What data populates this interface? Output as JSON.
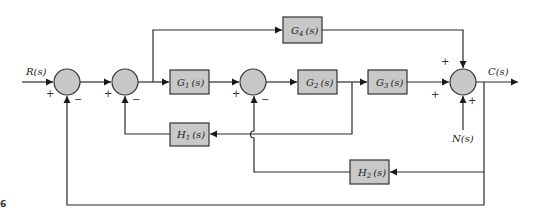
{
  "diagram": {
    "type": "block-diagram",
    "signals": {
      "input": "R(s)",
      "output": "C(s)",
      "disturbance": "N(s)"
    },
    "blocks": [
      {
        "id": "G1",
        "base": "G",
        "sub": "1",
        "arg": "(s)"
      },
      {
        "id": "G2",
        "base": "G",
        "sub": "2",
        "arg": "(s)"
      },
      {
        "id": "G3",
        "base": "G",
        "sub": "3",
        "arg": "(s)"
      },
      {
        "id": "G4",
        "base": "G",
        "sub": "4",
        "arg": "(s)"
      },
      {
        "id": "H1",
        "base": "H",
        "sub": "1",
        "arg": "(s)"
      },
      {
        "id": "H2",
        "base": "H",
        "sub": "2",
        "arg": "(s)"
      }
    ],
    "summing_junctions": [
      {
        "id": "S1",
        "signs": {
          "left": "+",
          "bottom": "−"
        }
      },
      {
        "id": "S2",
        "signs": {
          "left": "+",
          "bottom": "−"
        }
      },
      {
        "id": "S3",
        "signs": {
          "left": "+",
          "bottom": "−"
        }
      },
      {
        "id": "S4",
        "signs": {
          "top": "+",
          "left": "+",
          "bottom": "+"
        }
      }
    ],
    "corner_mark": "6",
    "colors": {
      "block_fill": "#c8c8c8",
      "line": "#2a2a2a"
    }
  }
}
